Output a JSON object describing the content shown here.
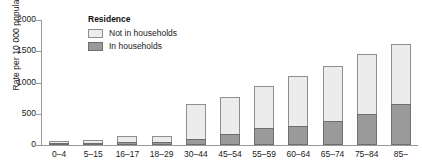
{
  "chart_data": {
    "type": "bar",
    "stacked": true,
    "title": "",
    "xlabel": "",
    "ylabel": "Rate per 10 000 population",
    "ylim": [
      0,
      2000
    ],
    "yticks": [
      0,
      500,
      1000,
      1500,
      2000
    ],
    "ytick_labels": [
      "0",
      "500",
      "1000",
      "1500",
      "2000"
    ],
    "grid": false,
    "legend": {
      "title": "Residence",
      "position": "top-left-inside",
      "entries": [
        {
          "name": "Not in households",
          "color": "#ececec"
        },
        {
          "name": "In households",
          "color": "#9a9a9a"
        }
      ]
    },
    "categories": [
      "0–4",
      "5–15",
      "16–17",
      "18–29",
      "30–44",
      "45–54",
      "55–59",
      "60–64",
      "65–74",
      "75–84",
      "85–"
    ],
    "series": [
      {
        "name": "In households",
        "color": "#9a9a9a",
        "values": [
          35,
          40,
          45,
          55,
          90,
          180,
          280,
          310,
          380,
          500,
          650
        ]
      },
      {
        "name": "Not in households",
        "color": "#ececec",
        "values": [
          35,
          45,
          105,
          95,
          560,
          590,
          670,
          790,
          880,
          950,
          960
        ]
      }
    ],
    "totals": [
      70,
      85,
      150,
      150,
      650,
      770,
      950,
      1100,
      1260,
      1450,
      1610
    ]
  },
  "axis": {
    "y_label": "Rate per 10 000 population"
  }
}
